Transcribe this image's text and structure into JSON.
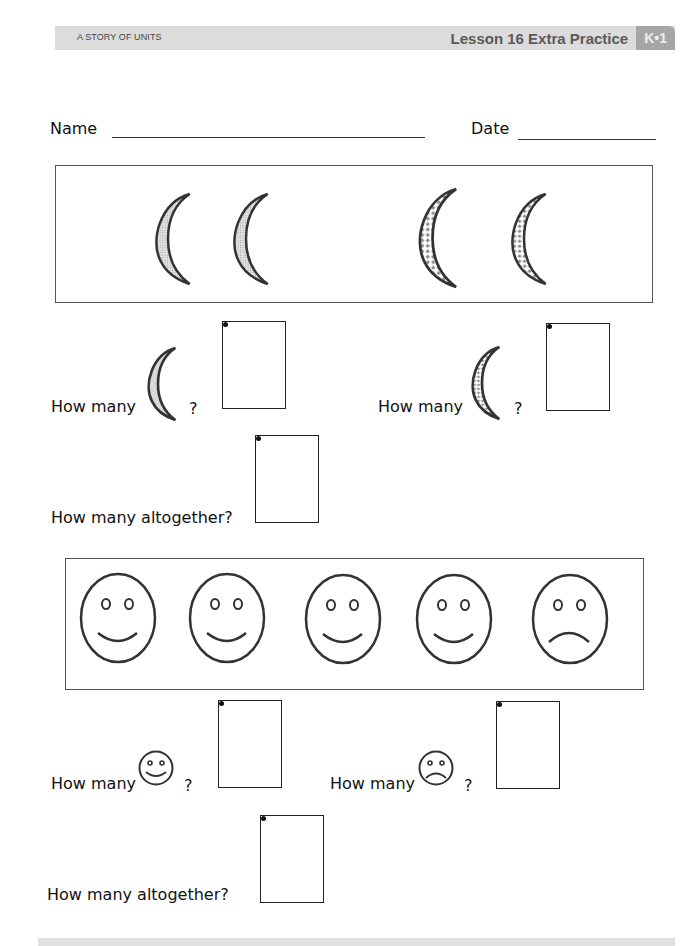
{
  "header": {
    "series": "A STORY OF UNITS",
    "lesson_title": "Lesson 16 Extra Practice",
    "module_badge": "K•1"
  },
  "form": {
    "name_label": "Name",
    "date_label": "Date",
    "name_value": "",
    "date_value": ""
  },
  "section1": {
    "picture_box": {
      "items": [
        {
          "shape": "crescent-moon",
          "pattern": "dotted-gray"
        },
        {
          "shape": "crescent-moon",
          "pattern": "dotted-gray"
        },
        {
          "shape": "crescent-moon",
          "pattern": "checkered"
        },
        {
          "shape": "crescent-moon",
          "pattern": "checkered"
        }
      ]
    },
    "questions": [
      {
        "prefix": "How many",
        "icon": "gray-moon-icon",
        "suffix": "?",
        "answer": ""
      },
      {
        "prefix": "How many",
        "icon": "checkered-moon-icon",
        "suffix": "?",
        "answer": ""
      }
    ],
    "total_question": {
      "label": "How many altogether?",
      "answer": ""
    }
  },
  "section2": {
    "picture_box": {
      "items": [
        {
          "shape": "face",
          "mood": "happy"
        },
        {
          "shape": "face",
          "mood": "happy"
        },
        {
          "shape": "face",
          "mood": "happy"
        },
        {
          "shape": "face",
          "mood": "happy"
        },
        {
          "shape": "face",
          "mood": "sad"
        }
      ]
    },
    "questions": [
      {
        "prefix": "How many",
        "icon": "happy-face-icon",
        "suffix": "?",
        "answer": ""
      },
      {
        "prefix": "How many",
        "icon": "sad-face-icon",
        "suffix": "?",
        "answer": ""
      }
    ],
    "total_question": {
      "label": "How many altogether?",
      "answer": ""
    }
  },
  "colors": {
    "header_bar": "#dcdcdc",
    "header_badge": "#a6a6a6",
    "moon_gray_fill": "#d0d0d0",
    "moon_check_fill": "#8c8c8c",
    "outline": "#333333"
  }
}
